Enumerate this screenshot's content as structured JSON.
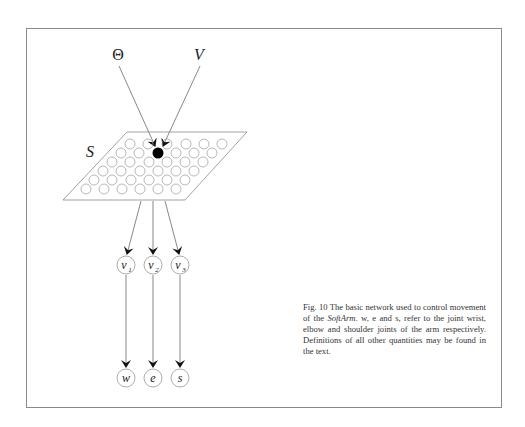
{
  "figure": {
    "inputs": [
      {
        "id": "theta",
        "label": "Θ"
      },
      {
        "id": "v",
        "label": "V"
      }
    ],
    "sheet_label": "S",
    "intermediate_nodes": [
      {
        "id": "v1",
        "label": "v",
        "sub": "1"
      },
      {
        "id": "v2",
        "label": "v",
        "sub": "2"
      },
      {
        "id": "v3",
        "label": "v",
        "sub": "3"
      }
    ],
    "output_nodes": [
      {
        "id": "w",
        "label": "w"
      },
      {
        "id": "e",
        "label": "e"
      },
      {
        "id": "s",
        "label": "s"
      }
    ],
    "grid": {
      "rows": 6,
      "cols": 6,
      "active_node": "row 2, col 3"
    },
    "colors": {
      "line": "#555555",
      "node_stroke": "#8a8a8a",
      "active": "#000000",
      "frame": "#8a8a8a"
    }
  },
  "caption": {
    "prefix": "Fig. 10 The basic network used to control movement of the ",
    "emph": "SoftArm",
    "suffix": ". w, e and s, refer to the joint wrist, elbow and shoulder joints of the arm respectively. Definitions of all other quantities may be found in the text."
  }
}
